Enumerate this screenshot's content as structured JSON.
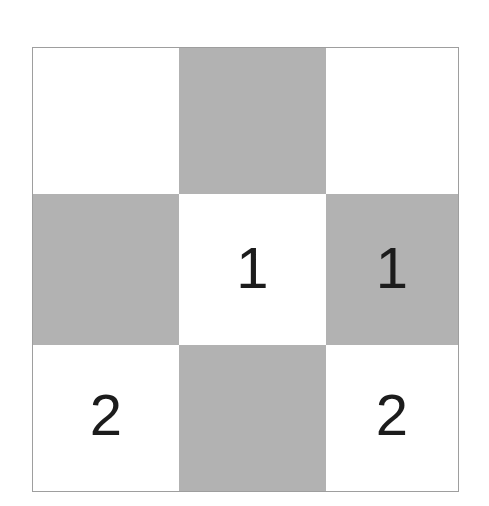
{
  "figure": {
    "title_sliver": "",
    "grid": {
      "rows": 3,
      "columns": 3,
      "shading_pattern": "checkerboard",
      "colors": {
        "light_cell": "#ffffff",
        "dark_cell": "#b2b2b2",
        "border": "#9e9e9e",
        "digit": "#1c1c1c",
        "page_background": "#ffffff"
      },
      "cells": [
        {
          "id": "r1c1",
          "row": 1,
          "column": 1,
          "shade": "white",
          "label": ""
        },
        {
          "id": "r1c2",
          "row": 1,
          "column": 2,
          "shade": "gray",
          "label": ""
        },
        {
          "id": "r1c3",
          "row": 1,
          "column": 3,
          "shade": "white",
          "label": ""
        },
        {
          "id": "r2c1",
          "row": 2,
          "column": 1,
          "shade": "gray",
          "label": ""
        },
        {
          "id": "r2c2",
          "row": 2,
          "column": 2,
          "shade": "white",
          "label": "1"
        },
        {
          "id": "r2c3",
          "row": 2,
          "column": 3,
          "shade": "gray",
          "label": "1"
        },
        {
          "id": "r3c1",
          "row": 3,
          "column": 1,
          "shade": "white",
          "label": "2"
        },
        {
          "id": "r3c2",
          "row": 3,
          "column": 2,
          "shade": "gray",
          "label": ""
        },
        {
          "id": "r3c3",
          "row": 3,
          "column": 3,
          "shade": "white",
          "label": "2"
        }
      ]
    }
  }
}
